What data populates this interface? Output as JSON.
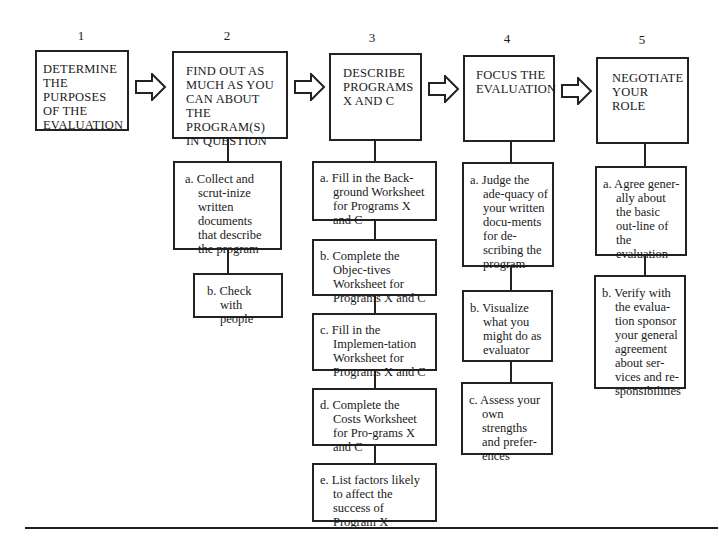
{
  "diagram": {
    "type": "flowchart",
    "steps": [
      {
        "number": "1",
        "title": "DETERMINE THE PURPOSES OF THE EVALUATION",
        "substeps": []
      },
      {
        "number": "2",
        "title": "FIND OUT AS MUCH AS YOU CAN ABOUT THE PROGRAM(S) IN QUESTION",
        "substeps": [
          "a. Collect and scrut-inize written documents that describe the program",
          "b. Check with people"
        ]
      },
      {
        "number": "3",
        "title": "DESCRIBE PROGRAMS X AND C",
        "substeps": [
          "a. Fill in the Back-ground Worksheet for Programs X and C",
          "b. Complete the Objec-tives Worksheet for Programs X and C",
          "c. Fill in the Implemen-tation Worksheet for Programs X and C",
          "d. Complete the Costs Worksheet for Pro-grams X and C",
          "e. List factors likely to affect the success of Program X"
        ]
      },
      {
        "number": "4",
        "title": "FOCUS THE EVALUATION",
        "substeps": [
          "a. Judge the ade-quacy of your written docu-ments for de-scribing the program",
          "b. Visualize what you might do as evaluator",
          "c. Assess your own strengths and prefer-ences"
        ]
      },
      {
        "number": "5",
        "title": "NEGOTIATE YOUR ROLE",
        "substeps": [
          "a. Agree gener-ally about the basic out-line of the evaluation",
          "b. Verify with the evalua-tion sponsor your general agreement about ser-vices and re-sponsibilities"
        ]
      }
    ],
    "connector": "hollow-right-arrow",
    "colors": {
      "stroke": "#222222",
      "background": "#ffffff",
      "text": "#1a1a1a"
    }
  }
}
